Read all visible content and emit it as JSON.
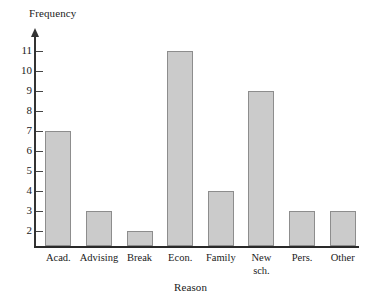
{
  "chart_data": {
    "type": "bar",
    "title": "",
    "xlabel": "Reason",
    "ylabel": "Frequency",
    "categories": [
      "Acad.",
      "Advising",
      "Break",
      "Econ.",
      "Family",
      "New\nsch.",
      "Pers.",
      "Other"
    ],
    "values": [
      7,
      3,
      2,
      11,
      4,
      9,
      3,
      3
    ],
    "ytick_labels": [
      "2",
      "3",
      "4",
      "5",
      "6",
      "7",
      "8",
      "9",
      "10",
      "11"
    ],
    "ytick_values": [
      2,
      3,
      4,
      5,
      6,
      7,
      8,
      9,
      10,
      11
    ],
    "ylim": [
      1.25,
      11.75
    ],
    "grid": false,
    "legend": null,
    "bar_color": "#cbcbcb",
    "bar_edge_color": "#8d8d8d",
    "axis_color": "#333333"
  }
}
